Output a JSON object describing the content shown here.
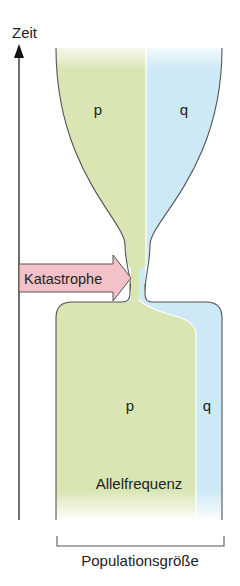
{
  "axis": {
    "y_label": "Zeit",
    "x_label": "Populationsgröße"
  },
  "alleles": {
    "top_p": "p",
    "top_q": "q",
    "bottom_p": "p",
    "bottom_q": "q"
  },
  "event": {
    "label": "Katastrophe"
  },
  "caption": {
    "frequency_label": "Allelfrequenz"
  },
  "colors": {
    "p_green": "#d9e6b3",
    "q_blue": "#cde9f5",
    "arrow_pink": "#f3c2c8",
    "outline": "#555555"
  }
}
